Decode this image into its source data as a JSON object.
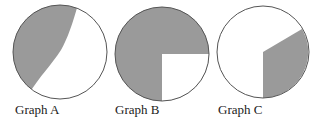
{
  "colors": {
    "shaded": "#9a9a9a",
    "outline": "#555555",
    "unshaded": "#ffffff"
  },
  "graphs": [
    {
      "label": "Graph A",
      "description": "Circle with left portion shaded, bounded by a curved line from top to lower-left",
      "approx_shaded_fraction": 0.4
    },
    {
      "label": "Graph B",
      "description": "Circle with three-quarters shaded; lower-right quadrant unshaded",
      "approx_shaded_fraction": 0.75
    },
    {
      "label": "Graph C",
      "description": "Circle with a sector shaded from 6 o'clock to about 2 o'clock (clockwise from right side)",
      "approx_shaded_fraction": 0.33
    }
  ]
}
